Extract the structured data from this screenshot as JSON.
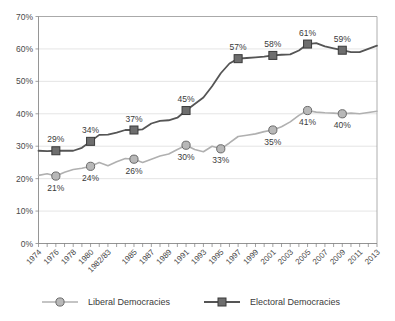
{
  "chart_data": {
    "type": "line",
    "title": "",
    "xlabel": "",
    "ylabel": "",
    "ylim": [
      0,
      70
    ],
    "y_ticks": [
      "0%",
      "10%",
      "20%",
      "30%",
      "40%",
      "50%",
      "60%",
      "70%"
    ],
    "y_tick_values": [
      0,
      10,
      20,
      30,
      40,
      50,
      60,
      70
    ],
    "grid": true,
    "legend_position": "bottom",
    "x": [
      1974,
      1975,
      1976,
      1977,
      1978,
      1979,
      1980,
      1981,
      1982,
      1983,
      1984,
      1985,
      1986,
      1987,
      1988,
      1989,
      1990,
      1991,
      1992,
      1993,
      1994,
      1995,
      1996,
      1997,
      1998,
      1999,
      2000,
      2001,
      2002,
      2003,
      2004,
      2005,
      2006,
      2007,
      2008,
      2009,
      2010,
      2011,
      2012,
      2013
    ],
    "x_tick_labels": [
      "1974",
      "1976",
      "1978",
      "1980",
      "1982/83",
      "1985",
      "1987",
      "1989",
      "1991",
      "1993",
      "1995",
      "1997",
      "1999",
      "2001",
      "2003",
      "2005",
      "2007",
      "2009",
      "2011",
      "2013"
    ],
    "x_tick_indices": [
      0,
      2,
      4,
      6,
      8,
      11,
      13,
      15,
      17,
      19,
      21,
      23,
      25,
      27,
      29,
      31,
      33,
      35,
      37,
      39
    ],
    "series": [
      {
        "name": "Liberal Democracies",
        "marker": "circle",
        "color": "#b0b0b0",
        "marker_fill": "#b8b8b8",
        "marker_stroke": "#6a6a6a",
        "values": [
          21,
          21.5,
          20.8,
          22.0,
          22.8,
          23.2,
          23.8,
          25.0,
          24.0,
          25.2,
          26.2,
          26.0,
          25.0,
          26.0,
          27.0,
          27.6,
          29.0,
          30.3,
          29.0,
          28.3,
          30.0,
          29.2,
          31.0,
          33.0,
          33.4,
          33.8,
          34.5,
          35.0,
          36.0,
          37.5,
          39.5,
          41.0,
          40.5,
          40.3,
          40.2,
          40.0,
          40.2,
          40.0,
          40.4,
          40.8
        ],
        "labeled_points": [
          {
            "index": 2,
            "label": "21%",
            "position": "below"
          },
          {
            "index": 6,
            "label": "24%",
            "position": "below"
          },
          {
            "index": 11,
            "label": "26%",
            "position": "below"
          },
          {
            "index": 17,
            "label": "30%",
            "position": "below"
          },
          {
            "index": 21,
            "label": "33%",
            "position": "below"
          },
          {
            "index": 27,
            "label": "35%",
            "position": "below"
          },
          {
            "index": 31,
            "label": "41%",
            "position": "below"
          },
          {
            "index": 35,
            "label": "40%",
            "position": "below"
          }
        ]
      },
      {
        "name": "Electoral Democracies",
        "marker": "square",
        "color": "#555555",
        "marker_fill": "#6e6e6e",
        "marker_stroke": "#3a3a3a",
        "values": [
          28.6,
          28.5,
          28.6,
          28.6,
          28.6,
          29.5,
          31.5,
          33.5,
          33.6,
          34.2,
          35.0,
          35.0,
          35.2,
          37.0,
          37.8,
          38.0,
          38.8,
          41.0,
          43.0,
          45.0,
          48.5,
          52.5,
          55.5,
          57.0,
          57.2,
          57.4,
          57.6,
          58.0,
          58.2,
          58.3,
          59.5,
          61.5,
          61.8,
          60.8,
          60.2,
          59.6,
          59.0,
          59.0,
          60.0,
          61.0
        ],
        "labeled_points": [
          {
            "index": 2,
            "label": "29%",
            "position": "above"
          },
          {
            "index": 6,
            "label": "34%",
            "position": "above"
          },
          {
            "index": 11,
            "label": "37%",
            "position": "above"
          },
          {
            "index": 17,
            "label": "45%",
            "position": "above"
          },
          {
            "index": 23,
            "label": "57%",
            "position": "above"
          },
          {
            "index": 27,
            "label": "58%",
            "position": "above"
          },
          {
            "index": 31,
            "label": "61%",
            "position": "above"
          },
          {
            "index": 35,
            "label": "59%",
            "position": "above"
          }
        ]
      }
    ]
  },
  "legend": {
    "items": [
      {
        "label": "Liberal Democracies",
        "marker": "circle"
      },
      {
        "label": "Electoral Democracies",
        "marker": "square"
      }
    ]
  },
  "colors": {
    "liberal": "#b0b0b0",
    "electoral": "#555555",
    "grid": "#d8d8d8",
    "axis": "#8a8a8a",
    "text": "#3a3a3a",
    "background": "#ffffff"
  }
}
